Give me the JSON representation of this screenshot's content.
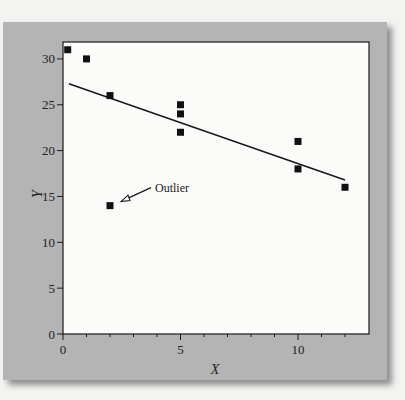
{
  "chart_data": {
    "type": "scatter",
    "title": "",
    "xlabel": "X",
    "ylabel": "Y",
    "xlim": [
      0,
      13
    ],
    "ylim": [
      0,
      32
    ],
    "x_ticks": [
      0,
      5,
      10
    ],
    "x_tick_labels": [
      "0",
      "5",
      "10"
    ],
    "x_minor_ticks": [
      1,
      2,
      3,
      4,
      6,
      7,
      8,
      9,
      11,
      12
    ],
    "y_ticks": [
      0,
      5,
      10,
      15,
      20,
      25,
      30
    ],
    "y_tick_labels": [
      "0",
      "5",
      "10",
      "15",
      "20",
      "25",
      "30"
    ],
    "grid": false,
    "legend": null,
    "series": [
      {
        "name": "data",
        "marker": "square",
        "points": [
          {
            "x": 0.2,
            "y": 31
          },
          {
            "x": 1,
            "y": 30
          },
          {
            "x": 2,
            "y": 26
          },
          {
            "x": 2,
            "y": 14
          },
          {
            "x": 5,
            "y": 25
          },
          {
            "x": 5,
            "y": 24
          },
          {
            "x": 5,
            "y": 22
          },
          {
            "x": 10,
            "y": 21
          },
          {
            "x": 10,
            "y": 18
          },
          {
            "x": 12,
            "y": 16
          }
        ]
      },
      {
        "name": "regression line",
        "type": "line",
        "points": [
          {
            "x": 0.25,
            "y": 27.3
          },
          {
            "x": 12,
            "y": 16.8
          }
        ]
      }
    ],
    "annotations": [
      {
        "text": "Outlier",
        "target": {
          "x": 2,
          "y": 14
        },
        "arrow": "open-triangle"
      }
    ]
  },
  "colors": {
    "background": "#f3f3f1",
    "panel": "#b4b4b4",
    "plot_area": "#fbfbfa",
    "ink": "#1a1a1a"
  }
}
